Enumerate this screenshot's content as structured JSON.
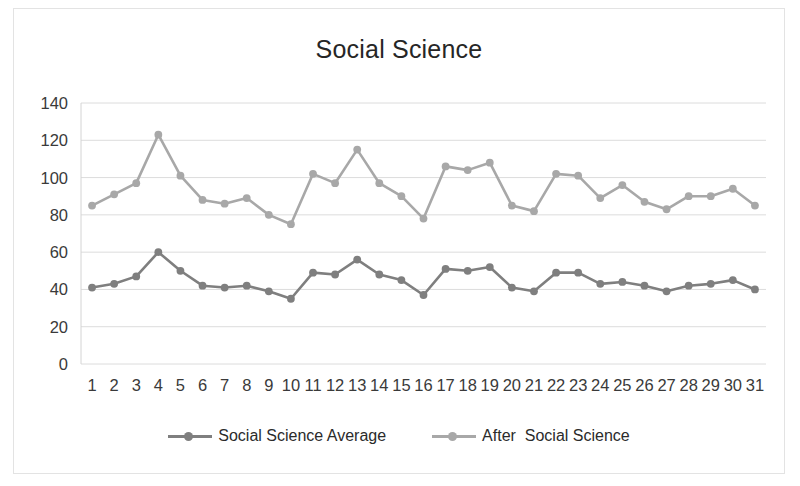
{
  "chart_data": {
    "type": "line",
    "title": "Social Science",
    "xlabel": "",
    "ylabel": "",
    "ylim": [
      0,
      140
    ],
    "ytick_step": 20,
    "yticks": [
      "0",
      "20",
      "40",
      "60",
      "80",
      "100",
      "120",
      "140"
    ],
    "grid": true,
    "legend_position": "bottom",
    "categories": [
      "1",
      "2",
      "3",
      "4",
      "5",
      "6",
      "7",
      "8",
      "9",
      "10",
      "11",
      "12",
      "13",
      "14",
      "15",
      "16",
      "17",
      "18",
      "19",
      "20",
      "21",
      "22",
      "23",
      "24",
      "25",
      "26",
      "27",
      "28",
      "29",
      "30",
      "31"
    ],
    "series": [
      {
        "name": "Social Science Average",
        "color": "#7f7f7f",
        "values": [
          41,
          43,
          47,
          60,
          50,
          42,
          41,
          42,
          39,
          35,
          49,
          48,
          56,
          48,
          45,
          37,
          51,
          50,
          52,
          41,
          39,
          49,
          49,
          43,
          44,
          42,
          39,
          42,
          43,
          45,
          40
        ]
      },
      {
        "name": "After  Social Science",
        "color": "#a8a8a8",
        "values": [
          85,
          91,
          97,
          123,
          101,
          88,
          86,
          89,
          80,
          75,
          102,
          97,
          115,
          97,
          90,
          78,
          106,
          104,
          108,
          85,
          82,
          102,
          101,
          89,
          96,
          87,
          83,
          90,
          90,
          94,
          85
        ]
      }
    ]
  },
  "legend": {
    "items": [
      {
        "label": "Social Science Average",
        "color": "#7f7f7f"
      },
      {
        "label": "After  Social Science",
        "color": "#a8a8a8"
      }
    ]
  },
  "colors": {
    "series_dark": "#7f7f7f",
    "series_light": "#a8a8a8",
    "gridline": "#dcdcdc",
    "axis": "#d4d4d4",
    "frame": "#e3e3e3",
    "text": "#3a3a3a",
    "title": "#262626"
  }
}
